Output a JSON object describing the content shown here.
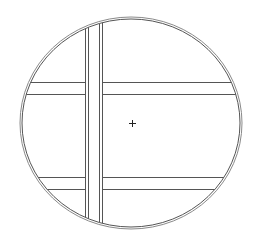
{
  "diagram": {
    "type": "technical-drawing",
    "background": "#ffffff",
    "stroke_color": "#555555",
    "stroke_light": "#8a8a8a",
    "outline": {
      "shape": "ellipse",
      "cx": 131,
      "cy": 123,
      "rx_outer": 111,
      "ry_outer": 106,
      "rx_inner": 109,
      "ry_inner": 104
    },
    "vertical_strip": {
      "lines_x": [
        85,
        88,
        99,
        102
      ]
    },
    "horizontal_bands": [
      {
        "name": "upper-band",
        "lines_y": [
          82,
          94
        ]
      },
      {
        "name": "lower-band",
        "lines_y": [
          177,
          189
        ]
      }
    ],
    "center_marker": {
      "x": 132,
      "y": 123,
      "size": 3,
      "glyph": "cross"
    }
  }
}
